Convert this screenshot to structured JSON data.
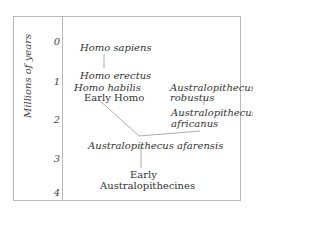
{
  "axis": {
    "label": "Millions of years",
    "ticks": [
      "0",
      "1",
      "2",
      "3",
      "4"
    ]
  },
  "taxa": {
    "homo_sapiens": "Homo sapiens",
    "homo_erectus": "Homo erectus",
    "homo_habilis": "Homo habilis",
    "early_homo": "Early Homo",
    "a_robustus_1": "Australopithecus",
    "a_robustus_2": "robustus",
    "a_africanus_1": "Australopithecus",
    "a_africanus_2": "africanus",
    "a_afarensis": "Australopithecus afarensis",
    "early_austr_1": "Early",
    "early_austr_2": "Australopithecines"
  }
}
